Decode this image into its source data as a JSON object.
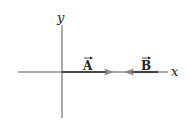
{
  "diagram": {
    "axes": {
      "x_label": "x",
      "y_label": "y"
    },
    "vectors": [
      {
        "name": "A",
        "label": "A",
        "direction": "+x",
        "start_x": 0,
        "end_x": 50
      },
      {
        "name": "B",
        "label": "B",
        "direction": "-x",
        "start_x": 96,
        "end_x": 64
      }
    ],
    "colors": {
      "axis": "#555555",
      "vector": "#444444",
      "arrowhead": "#888888",
      "text": "#222222"
    }
  }
}
